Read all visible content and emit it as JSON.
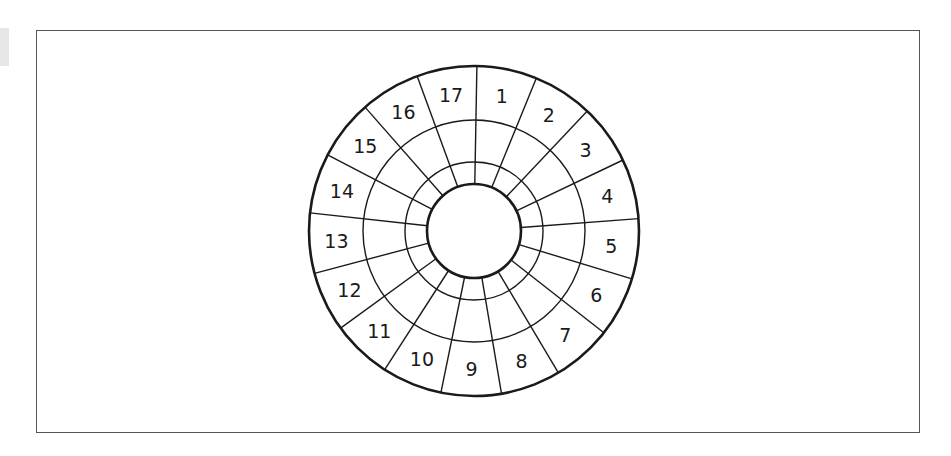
{
  "figure": {
    "sector_count": 17,
    "sector_labels": [
      "1",
      "2",
      "3",
      "4",
      "5",
      "6",
      "7",
      "8",
      "9",
      "10",
      "11",
      "12",
      "13",
      "14",
      "15",
      "16",
      "17"
    ],
    "label_order": "clockwise starting at top, right of vertical",
    "rings": 3,
    "has_center_circle": true
  },
  "geometry": {
    "center": [
      474,
      231
    ],
    "outer_radius": 165,
    "ring_radii": [
      111,
      69
    ],
    "inner_radius": 47,
    "start_angle_deg": 1,
    "label_radius": 138
  },
  "colors": {
    "stroke": "#1a1a1a",
    "frame": "#555555",
    "background": "#ffffff"
  }
}
